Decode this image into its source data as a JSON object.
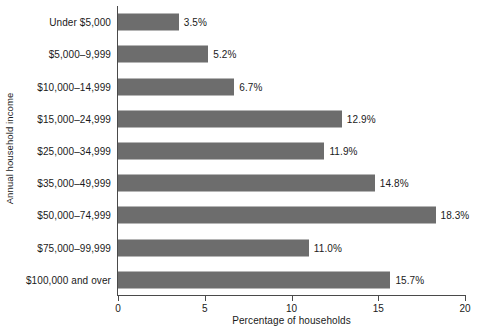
{
  "chart_data": {
    "type": "bar",
    "orientation": "horizontal",
    "title": "",
    "xlabel": "Percentage of households",
    "ylabel": "Annual household income",
    "xlim": [
      0,
      20
    ],
    "xticks": [
      0,
      5,
      10,
      15,
      20
    ],
    "xtick_labels": [
      "0",
      "5",
      "10",
      "15",
      "20"
    ],
    "grid": false,
    "legend": null,
    "bar_color": "#6d6d6d",
    "categories": [
      "Under $5,000",
      "$5,000–9,999",
      "$10,000–14,999",
      "$15,000–24,999",
      "$25,000–34,999",
      "$35,000–49,999",
      "$50,000–74,999",
      "$75,000–99,999",
      "$100,000 and over"
    ],
    "values": [
      3.5,
      5.2,
      6.7,
      12.9,
      11.9,
      14.8,
      18.3,
      11.0,
      15.7
    ],
    "value_labels": [
      "3.5%",
      "5.2%",
      "6.7%",
      "12.9%",
      "11.9%",
      "14.8%",
      "18.3%",
      "11.0%",
      "15.7%"
    ]
  }
}
